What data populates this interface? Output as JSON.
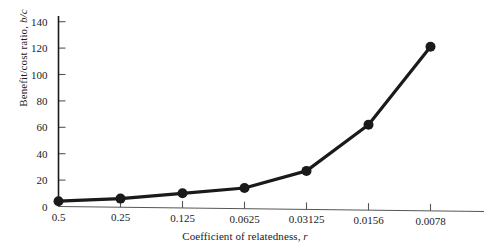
{
  "chart_data": {
    "type": "line",
    "title": "",
    "xlabel": "Coefficient of relatedness, r",
    "ylabel": "Benefit/cost ratio, b/c",
    "categories": [
      "0.5",
      "0.25",
      "0.125",
      "0.0625",
      "0.03125",
      "0.0156",
      "0.0078"
    ],
    "values": [
      4,
      6,
      10,
      14,
      27,
      62,
      121
    ],
    "series": [
      {
        "name": "Benefit/cost ratio threshold",
        "values": [
          4,
          6,
          10,
          14,
          27,
          62,
          121
        ]
      }
    ],
    "x_tick_labels": [
      "0.5",
      "0.25",
      "0.125",
      "0.0625",
      "0.03125",
      "0.0156",
      "0.0078"
    ],
    "y_tick_labels": [
      "0",
      "20",
      "40",
      "60",
      "80",
      "100",
      "120",
      "140"
    ],
    "y_tick_values": [
      0,
      20,
      40,
      60,
      80,
      100,
      120,
      140
    ],
    "ylim": [
      0,
      148
    ],
    "grid": false,
    "legend": "none",
    "marker": "filled-circle",
    "line_color": "#1a1a1a",
    "marker_color": "#1a1a1a",
    "background_color": "#ffffff"
  },
  "axes": {
    "ylabel_main": "Benefit/cost ratio, ",
    "ylabel_italic": "b/c",
    "xlabel_main": "Coefficient of relatedness, ",
    "xlabel_italic": "r"
  }
}
